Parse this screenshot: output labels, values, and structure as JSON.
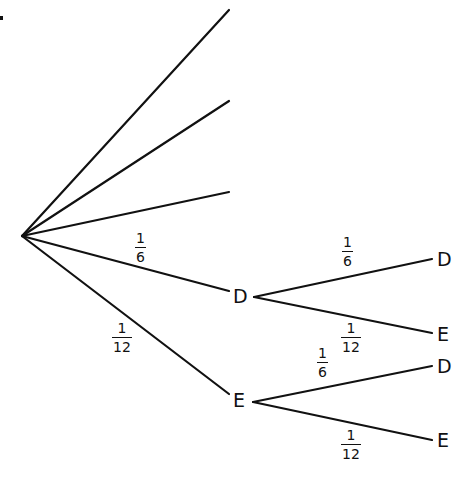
{
  "diagram": {
    "type": "probability-tree",
    "colors": {
      "line": "#111111",
      "background": "#ffffff"
    },
    "root": {
      "x": 22,
      "y": 236
    },
    "first_level": {
      "unlabeled_branches": [
        {
          "end": {
            "x": 229,
            "y": 10
          }
        },
        {
          "end": {
            "x": 229,
            "y": 101
          }
        },
        {
          "end": {
            "x": 229,
            "y": 192
          }
        }
      ],
      "labeled_branches": [
        {
          "node": "D",
          "probability": {
            "num": "1",
            "den": "6"
          },
          "end": {
            "x": 229,
            "y": 291
          }
        },
        {
          "node": "E",
          "probability": {
            "num": "1",
            "den": "12"
          },
          "end": {
            "x": 229,
            "y": 394
          }
        }
      ]
    },
    "second_level": [
      {
        "parent": "D",
        "branches": [
          {
            "node": "D",
            "probability": {
              "num": "1",
              "den": "6"
            }
          },
          {
            "node": "E",
            "probability": {
              "num": "1",
              "den": "12"
            }
          }
        ]
      },
      {
        "parent": "E",
        "branches": [
          {
            "node": "D",
            "probability": {
              "num": "1",
              "den": "6"
            }
          },
          {
            "node": "E",
            "probability": {
              "num": "1",
              "den": "12"
            }
          }
        ]
      }
    ]
  }
}
